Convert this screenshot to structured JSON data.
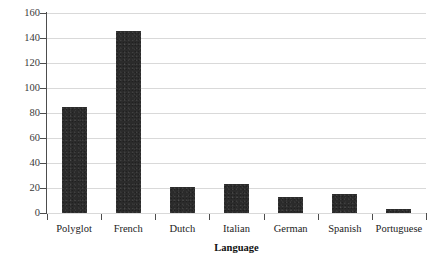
{
  "chart_data": {
    "type": "bar",
    "title": "",
    "xlabel": "Language",
    "ylabel": "Number of editions",
    "categories": [
      "Polyglot",
      "French",
      "Dutch",
      "Italian",
      "German",
      "Spanish",
      "Portuguese"
    ],
    "values": [
      85,
      146,
      21,
      23,
      13,
      15,
      3
    ],
    "ylim": [
      0,
      160
    ],
    "ytick_step": 20,
    "yticks": [
      0,
      20,
      40,
      60,
      80,
      100,
      120,
      140,
      160
    ],
    "ytick_labels": [
      "0",
      "20",
      "40",
      "60",
      "80",
      "100",
      "120",
      "140",
      "160"
    ],
    "grid": "horizontal",
    "legend": "none",
    "bar_color": "#2b2b2b",
    "gridline_color": "#d9d9d9",
    "axis_color": "#4d4d4d",
    "background_color": "#ffffff"
  }
}
